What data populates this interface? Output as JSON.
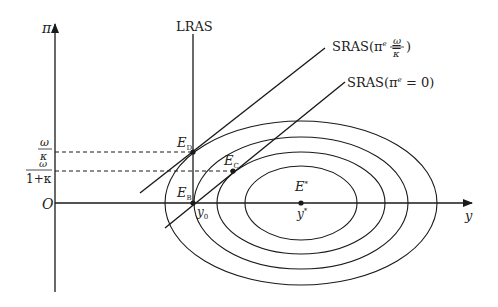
{
  "diagram": {
    "type": "macroeconomic-loss-function-diagram",
    "colors": {
      "line": "#1a1a1a",
      "background": "#ffffff",
      "text": "#222222"
    },
    "axes": {
      "y_axis_label": "π",
      "x_axis_label": "y",
      "origin_label": "O"
    },
    "y_ticks": {
      "upper": {
        "numerator": "ω",
        "denominator": "κ"
      },
      "lower": {
        "numerator": "ω",
        "denominator": "1+κ"
      }
    },
    "curves": {
      "lras_label": "LRAS",
      "sras_high": {
        "prefix": "SRAS(π",
        "superscript": "e",
        "equals": " = ",
        "frac_num": "ω",
        "frac_den": "κ",
        "suffix": ")"
      },
      "sras_zero": {
        "prefix": "SRAS(π",
        "superscript": "e",
        "rest": " = 0)"
      }
    },
    "points": {
      "ED": {
        "main": "E",
        "sub": "D"
      },
      "EC": {
        "main": "E",
        "sub": "C"
      },
      "EB": {
        "main": "E",
        "sub": "B"
      },
      "Estar": {
        "main": "E",
        "sup": "*"
      }
    },
    "x_ticks": {
      "y0": {
        "main": "y",
        "sub": "0"
      },
      "ystar": {
        "main": "y",
        "sup": "*"
      }
    },
    "loss_ellipses_count": 4
  }
}
